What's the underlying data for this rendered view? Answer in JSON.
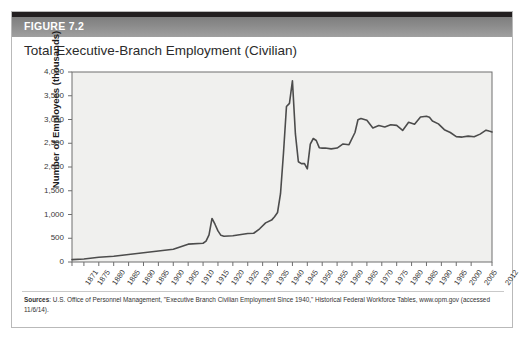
{
  "figure": {
    "label": "FIGURE 7.2",
    "title": "Total Executive-Branch Employment (Civilian)"
  },
  "sources": {
    "prefix": "Sources",
    "text": ": U.S. Office of Personnel Management, \"Executive Branch Civilian Employment Since 1940,\" Historical Federal Workforce Tables, www.opm.gov (accessed 11/6/14)."
  },
  "colors": {
    "banner": "#8c8c8c",
    "line": "#4c4c4c",
    "plot_background": "#f0f0ee",
    "frame": "#6e6e6e",
    "card_border": "#b9b9b9",
    "top_rule": "#231f20"
  },
  "chart_data": {
    "type": "line",
    "title": "Total Executive-Branch Employment (Civilian)",
    "xlabel": "Year",
    "ylabel": "Number of Employees (thousands)",
    "xlim": [
      1871,
      2012
    ],
    "ylim": [
      0,
      4000
    ],
    "ytick_labels": [
      "0",
      "500",
      "1,000",
      "1,500",
      "2,000",
      "2,500",
      "3,000",
      "3,500",
      "4,000"
    ],
    "ytick_values": [
      0,
      500,
      1000,
      1500,
      2000,
      2500,
      3000,
      3500,
      4000
    ],
    "xtick_labels": [
      "1871",
      "1875",
      "1880",
      "1885",
      "1890",
      "1895",
      "1900",
      "1905",
      "1910",
      "1915",
      "1920",
      "1925",
      "1930",
      "1935",
      "1940",
      "1945",
      "1950",
      "1955",
      "1960",
      "1965",
      "1970",
      "1975",
      "1980",
      "1985",
      "1990",
      "1995",
      "2000",
      "2005",
      "2012"
    ],
    "xtick_values": [
      1871,
      1875,
      1880,
      1885,
      1890,
      1895,
      1900,
      1905,
      1910,
      1915,
      1920,
      1925,
      1930,
      1935,
      1940,
      1945,
      1950,
      1955,
      1960,
      1965,
      1970,
      1975,
      1980,
      1985,
      1990,
      1995,
      2000,
      2005,
      2012
    ],
    "grid": false,
    "legend": null,
    "series": [
      {
        "name": "Total executive-branch civilian employment",
        "x": [
          1871,
          1875,
          1880,
          1885,
          1890,
          1895,
          1900,
          1905,
          1910,
          1915,
          1916,
          1917,
          1918,
          1919,
          1920,
          1921,
          1922,
          1925,
          1930,
          1932,
          1934,
          1936,
          1938,
          1939,
          1940,
          1941,
          1942,
          1943,
          1944,
          1945,
          1946,
          1947,
          1948,
          1949,
          1950,
          1951,
          1952,
          1953,
          1954,
          1955,
          1956,
          1958,
          1960,
          1962,
          1964,
          1966,
          1967,
          1968,
          1970,
          1972,
          1974,
          1976,
          1978,
          1980,
          1982,
          1984,
          1986,
          1988,
          1990,
          1991,
          1992,
          1994,
          1996,
          1998,
          2000,
          2002,
          2004,
          2006,
          2008,
          2010,
          2011,
          2012
        ],
        "y": [
          51,
          64,
          100,
          120,
          157,
          196,
          231,
          268,
          376,
          395,
          438,
          570,
          917,
          795,
          655,
          561,
          543,
          553,
          601,
          605,
          699,
          824,
          882,
          954,
          1042,
          1438,
          2296,
          3274,
          3340,
          3816,
          2696,
          2111,
          2071,
          2075,
          1961,
          2482,
          2600,
          2558,
          2407,
          2397,
          2399,
          2382,
          2399,
          2485,
          2470,
          2726,
          2995,
          3020,
          2982,
          2823,
          2874,
          2843,
          2888,
          2876,
          2770,
          2942,
          2899,
          3054,
          3067,
          3048,
          2969,
          2908,
          2786,
          2727,
          2640,
          2630,
          2650,
          2637,
          2692,
          2776,
          2756,
          2738
        ],
        "y_scaled_note": "plotted values are in thousands; peak 3,816 in 1945"
      }
    ],
    "annotations": [
      {
        "label": "World War I peak",
        "x": 1918,
        "y": 917
      },
      {
        "label": "World War II peak",
        "x": 1945,
        "y": 3816
      }
    ]
  }
}
